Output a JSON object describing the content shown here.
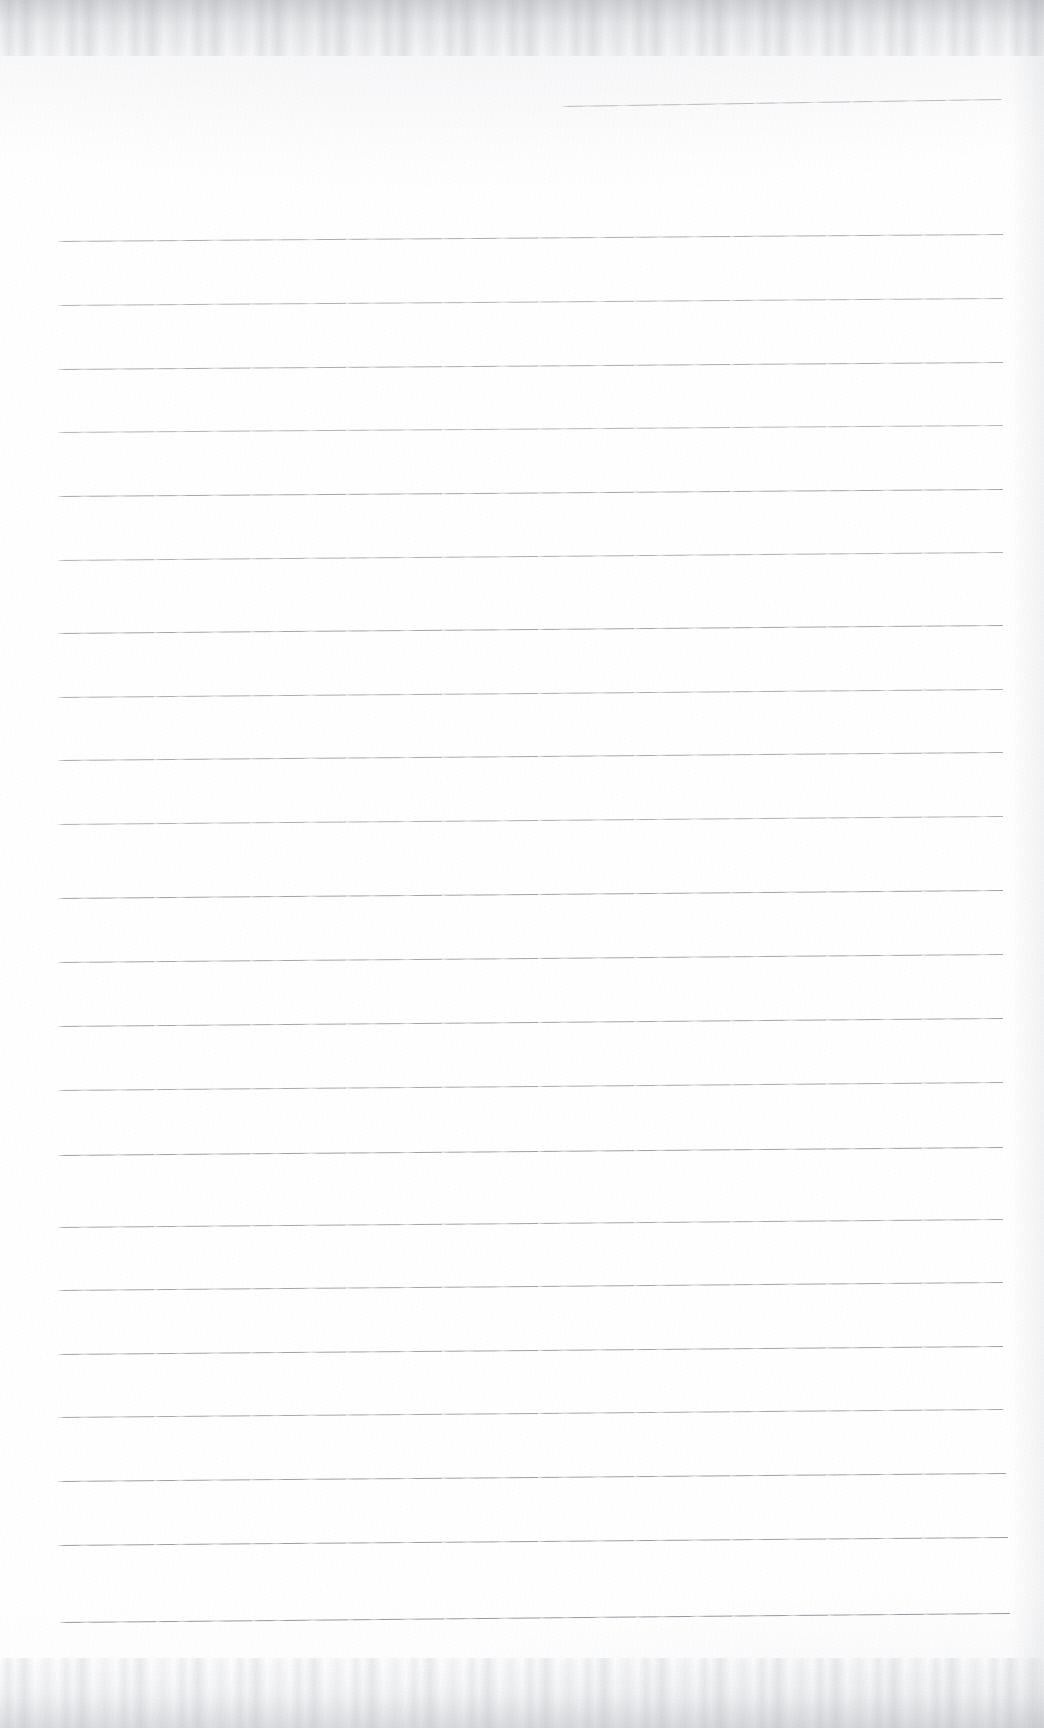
{
  "document": {
    "kind": "scanned-lined-paper",
    "title": "Blank ruled notebook page",
    "page_width": 1044,
    "page_height": 1728,
    "background_color": "#ffffff",
    "paper_tint": "#fefefe",
    "rule_color": "#8a8e95",
    "rule_thickness_px": 1,
    "has_text": false,
    "has_margin_rule": false,
    "visible_text": ""
  },
  "ruling": {
    "line_count": 23,
    "full_width_line_count": 22,
    "partial_line_count": 1,
    "left_margin_x": 58,
    "right_margin_x": 1003,
    "first_line_y": 104,
    "last_line_y": 1620,
    "line_spacing_px": 64,
    "skew_note": "lines rise slightly to the right",
    "lines": [
      {
        "index": 1,
        "x1": 562,
        "y1": 106,
        "x2": 1002,
        "y2": 99,
        "opacity": 0.58,
        "partial": true
      },
      {
        "index": 2,
        "x1": 58,
        "y1": 241,
        "x2": 1003,
        "y2": 234,
        "opacity": 0.72,
        "partial": false
      },
      {
        "index": 3,
        "x1": 58,
        "y1": 305,
        "x2": 1003,
        "y2": 298,
        "opacity": 0.68,
        "partial": false
      },
      {
        "index": 4,
        "x1": 58,
        "y1": 369,
        "x2": 1003,
        "y2": 362,
        "opacity": 0.74,
        "partial": false
      },
      {
        "index": 5,
        "x1": 58,
        "y1": 432,
        "x2": 1003,
        "y2": 425,
        "opacity": 0.66,
        "partial": false
      },
      {
        "index": 6,
        "x1": 58,
        "y1": 496,
        "x2": 1003,
        "y2": 489,
        "opacity": 0.78,
        "partial": false
      },
      {
        "index": 7,
        "x1": 58,
        "y1": 560,
        "x2": 1003,
        "y2": 552,
        "opacity": 0.7,
        "partial": false
      },
      {
        "index": 8,
        "x1": 58,
        "y1": 633,
        "x2": 1003,
        "y2": 625,
        "opacity": 0.8,
        "partial": false
      },
      {
        "index": 9,
        "x1": 58,
        "y1": 697,
        "x2": 1003,
        "y2": 689,
        "opacity": 0.72,
        "partial": false
      },
      {
        "index": 10,
        "x1": 58,
        "y1": 760,
        "x2": 1003,
        "y2": 752,
        "opacity": 0.76,
        "partial": false
      },
      {
        "index": 11,
        "x1": 58,
        "y1": 824,
        "x2": 1003,
        "y2": 816,
        "opacity": 0.7,
        "partial": false
      },
      {
        "index": 12,
        "x1": 58,
        "y1": 898,
        "x2": 1003,
        "y2": 890,
        "opacity": 0.82,
        "partial": false
      },
      {
        "index": 13,
        "x1": 58,
        "y1": 962,
        "x2": 1003,
        "y2": 954,
        "opacity": 0.78,
        "partial": false
      },
      {
        "index": 14,
        "x1": 58,
        "y1": 1026,
        "x2": 1003,
        "y2": 1018,
        "opacity": 0.8,
        "partial": false
      },
      {
        "index": 15,
        "x1": 58,
        "y1": 1090,
        "x2": 1003,
        "y2": 1082,
        "opacity": 0.76,
        "partial": false
      },
      {
        "index": 16,
        "x1": 58,
        "y1": 1155,
        "x2": 1003,
        "y2": 1147,
        "opacity": 0.84,
        "partial": false
      },
      {
        "index": 17,
        "x1": 58,
        "y1": 1227,
        "x2": 1003,
        "y2": 1219,
        "opacity": 0.78,
        "partial": false
      },
      {
        "index": 18,
        "x1": 58,
        "y1": 1290,
        "x2": 1003,
        "y2": 1282,
        "opacity": 0.8,
        "partial": false
      },
      {
        "index": 19,
        "x1": 58,
        "y1": 1354,
        "x2": 1003,
        "y2": 1346,
        "opacity": 0.82,
        "partial": false
      },
      {
        "index": 20,
        "x1": 58,
        "y1": 1417,
        "x2": 1003,
        "y2": 1409,
        "opacity": 0.78,
        "partial": false
      },
      {
        "index": 21,
        "x1": 58,
        "y1": 1481,
        "x2": 1006,
        "y2": 1473,
        "opacity": 0.84,
        "partial": false
      },
      {
        "index": 22,
        "x1": 58,
        "y1": 1545,
        "x2": 1008,
        "y2": 1537,
        "opacity": 0.86,
        "partial": false
      },
      {
        "index": 23,
        "x1": 60,
        "y1": 1622,
        "x2": 1010,
        "y2": 1613,
        "opacity": 0.9,
        "partial": false
      }
    ]
  },
  "artifacts": {
    "top_edge_label": "scan-noise-top",
    "bottom_edge_label": "scan-noise-bottom",
    "right_edge_label": "scan-shading-right",
    "grain_label": "paper-grain"
  }
}
